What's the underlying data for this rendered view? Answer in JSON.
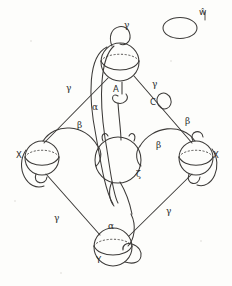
{
  "figure": {
    "caption_present": false,
    "background_color": "#fdfdfb",
    "ink_color": "#3a3a3a",
    "nodes": [
      {
        "id": "top",
        "label": "",
        "label_pos": "none",
        "cx": 120,
        "cy": 62,
        "r": 19
      },
      {
        "id": "left",
        "label": "X",
        "label_pos": "left",
        "cx": 42,
        "cy": 158,
        "r": 17
      },
      {
        "id": "center",
        "label": "",
        "label_pos": "none",
        "cx": 118,
        "cy": 160,
        "r": 23
      },
      {
        "id": "right",
        "label": "X",
        "label_pos": "right",
        "cx": 196,
        "cy": 158,
        "r": 17
      },
      {
        "id": "bottom",
        "label": "Y",
        "label_pos": "below",
        "cx": 113,
        "cy": 247,
        "r": 19
      }
    ],
    "isolated_loop": {
      "id": "free-ellipse",
      "label": "ŵ",
      "cx": 180,
      "cy": 28,
      "rx": 17,
      "ry": 10
    },
    "edge_labels": [
      {
        "id": "gamma-top",
        "text": "γ",
        "x": 127,
        "y": 26
      },
      {
        "id": "gamma-upper-left",
        "text": "γ",
        "x": 70,
        "y": 89
      },
      {
        "id": "gamma-upper-right",
        "text": "γ",
        "x": 155,
        "y": 85
      },
      {
        "id": "gamma-lower-left",
        "text": "γ",
        "x": 58,
        "y": 219
      },
      {
        "id": "gamma-lower-right",
        "text": "γ",
        "x": 169,
        "y": 212
      },
      {
        "id": "alpha-upper",
        "text": "α",
        "x": 96,
        "y": 108
      },
      {
        "id": "alpha-lower",
        "text": "α",
        "x": 112,
        "y": 227
      },
      {
        "id": "beta-left",
        "text": "β",
        "x": 81,
        "y": 126
      },
      {
        "id": "beta-center-right",
        "text": "β",
        "x": 159,
        "y": 146
      },
      {
        "id": "beta-right-upper",
        "text": "β",
        "x": 188,
        "y": 122
      },
      {
        "id": "zeta-center",
        "text": "ζ",
        "x": 139,
        "y": 175
      }
    ],
    "handle_labels": [
      {
        "id": "handle-A",
        "text": "A",
        "x": 116,
        "y": 90
      },
      {
        "id": "handle-C",
        "text": "C",
        "x": 153,
        "y": 103
      }
    ],
    "node_labels": [
      {
        "id": "node-label-left-X",
        "text": "X",
        "x": 19,
        "y": 155
      },
      {
        "id": "node-label-right-X",
        "text": "X",
        "x": 215,
        "y": 155
      },
      {
        "id": "node-label-bottom-Y",
        "text": "Y",
        "x": 99,
        "y": 261
      },
      {
        "id": "node-label-free-w",
        "text": "ŵ",
        "x": 202,
        "y": 13
      }
    ]
  }
}
